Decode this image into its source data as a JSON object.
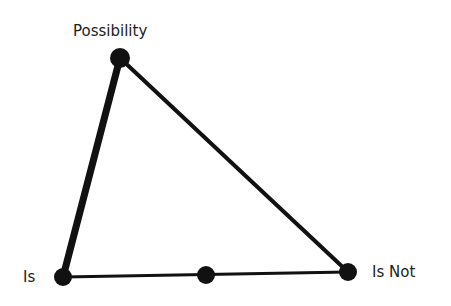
{
  "diagram": {
    "type": "triangle",
    "labels": {
      "top": "Possibility",
      "left": "Is",
      "right": "Is Not"
    },
    "nodes": [
      {
        "id": "possibility",
        "x": 120,
        "y": 58,
        "r": 10
      },
      {
        "id": "is",
        "x": 63,
        "y": 277,
        "r": 9
      },
      {
        "id": "is-not",
        "x": 348,
        "y": 272,
        "r": 9
      },
      {
        "id": "midpoint",
        "x": 206,
        "y": 275,
        "r": 9
      }
    ],
    "edges": [
      {
        "from": "possibility",
        "to": "is",
        "width": 7
      },
      {
        "from": "possibility",
        "to": "is-not",
        "width": 4
      },
      {
        "from": "is",
        "to": "is-not",
        "width": 3
      }
    ],
    "colors": {
      "stroke": "#111111",
      "text": "#222222",
      "background": "#ffffff"
    }
  }
}
